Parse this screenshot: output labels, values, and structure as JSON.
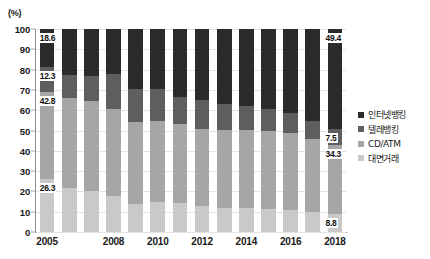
{
  "chart_data": {
    "type": "bar",
    "title": "",
    "subtitle": "",
    "xlabel": "",
    "ylabel": "(%)",
    "unit_label": "(%)",
    "stacked": true,
    "stack_mode": "percent",
    "ylim": [
      0,
      100
    ],
    "ytick_step": 10,
    "grid": true,
    "legend_position": "right",
    "categories": [
      "2005",
      "2006",
      "2007",
      "2008",
      "2009",
      "2010",
      "2011",
      "2012",
      "2013",
      "2014",
      "2015",
      "2016",
      "2017",
      "2018"
    ],
    "xtick_labels_shown": [
      "2005",
      "",
      "",
      "2008",
      "",
      "2010",
      "",
      "2012",
      "",
      "2014",
      "",
      "2016",
      "",
      "2018"
    ],
    "ytick_labels": [
      "0",
      "10",
      "20",
      "30",
      "40",
      "50",
      "60",
      "70",
      "80",
      "90",
      "100"
    ],
    "series": [
      {
        "name": "대면거래",
        "color": "#c9c9c9",
        "stack_order": 1,
        "values": [
          26.3,
          21.6,
          20.1,
          17.9,
          13.9,
          15.0,
          14.2,
          12.6,
          12.0,
          11.6,
          11.2,
          11.0,
          10.0,
          8.8
        ]
      },
      {
        "name": "CD/ATM",
        "color": "#a6a6a6",
        "stack_order": 2,
        "values": [
          42.8,
          44.5,
          44.5,
          42.6,
          40.3,
          39.5,
          39.0,
          38.0,
          38.3,
          38.5,
          38.5,
          38.0,
          36.0,
          34.3
        ]
      },
      {
        "name": "텔레뱅킹",
        "color": "#5e5e5e",
        "stack_order": 3,
        "values": [
          12.3,
          11.2,
          12.3,
          17.5,
          16.2,
          15.8,
          13.4,
          14.4,
          12.7,
          11.9,
          10.7,
          9.5,
          8.5,
          7.5
        ]
      },
      {
        "name": "인터넷뱅킹",
        "color": "#2b2b2b",
        "stack_order": 4,
        "values": [
          18.6,
          22.7,
          23.1,
          22.0,
          29.6,
          29.7,
          33.4,
          35.0,
          37.0,
          38.0,
          39.6,
          41.5,
          45.5,
          49.4
        ]
      }
    ],
    "annotations": [
      {
        "label": "18.6",
        "year": "2005",
        "series": "인터넷뱅킹"
      },
      {
        "label": "12.3",
        "year": "2005",
        "series": "텔레뱅킹"
      },
      {
        "label": "42.8",
        "year": "2005",
        "series": "CD/ATM"
      },
      {
        "label": "26.3",
        "year": "2005",
        "series": "대면거래"
      },
      {
        "label": "49.4",
        "year": "2018",
        "series": "인터넷뱅킹"
      },
      {
        "label": "7.5",
        "year": "2018",
        "series": "텔레뱅킹"
      },
      {
        "label": "34.3",
        "year": "2018",
        "series": "CD/ATM"
      },
      {
        "label": "8.8",
        "year": "2018",
        "series": "대면거래"
      }
    ],
    "legend": [
      {
        "label": "인터넷뱅킹",
        "color": "#2b2b2b"
      },
      {
        "label": "텔레뱅킹",
        "color": "#5e5e5e"
      },
      {
        "label": "CD/ATM",
        "color": "#a6a6a6"
      },
      {
        "label": "대면거래",
        "color": "#c9c9c9"
      }
    ],
    "colors": {
      "axis": "#8e8e8e",
      "grid": "#e3e3e3",
      "text": "#1a1a1a",
      "background": "#ffffff"
    }
  }
}
